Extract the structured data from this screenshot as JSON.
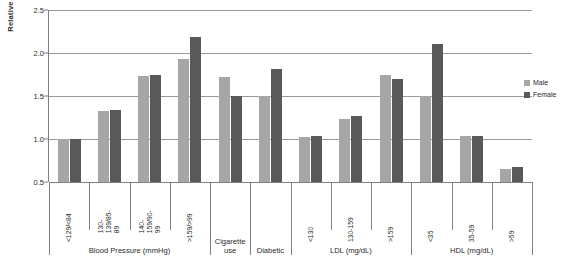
{
  "chart_data": {
    "type": "bar",
    "title": "",
    "xlabel": "",
    "ylabel": "Relative Risk",
    "ylim": [
      0.5,
      2.5
    ],
    "yticks": [
      "0.5",
      "1.0",
      "1.5",
      "2.0",
      "2.5"
    ],
    "grid": true,
    "legend_position": "right",
    "categories": [
      "<129/<84",
      "130-139/85-89",
      "140-159/90-99",
      ">159/>99",
      "Cigarette use",
      "Diabetic",
      "<130",
      "130-159",
      ">159",
      "<35",
      "35-59",
      ">59"
    ],
    "category_lines": [
      [
        "<129/<84"
      ],
      [
        "130-",
        "139/85-",
        "89"
      ],
      [
        "140-",
        "159/90-",
        "99"
      ],
      [
        ">159/>99"
      ],
      [
        ""
      ],
      [
        ""
      ],
      [
        "<130"
      ],
      [
        "130-159"
      ],
      [
        ">159"
      ],
      [
        "<35"
      ],
      [
        "35-59"
      ],
      [
        ">59"
      ]
    ],
    "groups": [
      {
        "label": "Blood Pressure (mmHg)",
        "label_lines": [
          "Blood Pressure (mmHg)"
        ],
        "span": 4
      },
      {
        "label": "Cigarette use",
        "label_lines": [
          "Cigarette",
          "use"
        ],
        "span": 1
      },
      {
        "label": "Diabetic",
        "label_lines": [
          "Diabetic"
        ],
        "span": 1
      },
      {
        "label": "LDL (mg/dL)",
        "label_lines": [
          "LDL (mg/dL)"
        ],
        "span": 3
      },
      {
        "label": "HDL (mg/dL)",
        "label_lines": [
          "HDL (mg/dL)"
        ],
        "span": 3
      }
    ],
    "series": [
      {
        "name": "Male",
        "color": "#a6a6a6",
        "values": [
          1.0,
          1.32,
          1.73,
          1.93,
          1.72,
          1.5,
          1.02,
          1.23,
          1.75,
          1.5,
          1.03,
          0.65
        ]
      },
      {
        "name": "Female",
        "color": "#595959",
        "values": [
          1.0,
          1.34,
          1.75,
          2.19,
          1.5,
          1.81,
          1.03,
          1.27,
          1.7,
          2.1,
          1.04,
          0.67
        ]
      }
    ]
  },
  "legend": {
    "male_label": "Male",
    "female_label": "Female"
  },
  "colors": {
    "male": "#a6a6a6",
    "female": "#595959",
    "axis": "#808080",
    "grid": "#9a9a9a"
  }
}
